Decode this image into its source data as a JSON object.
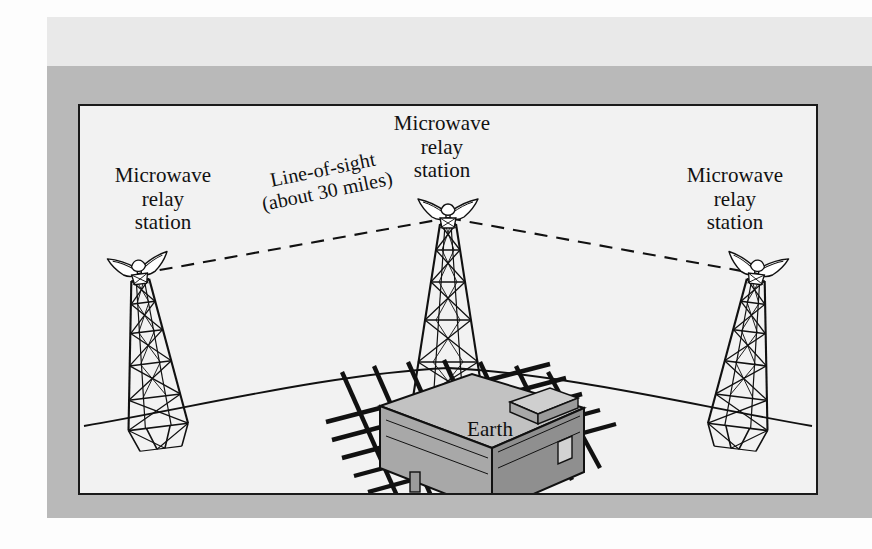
{
  "figure": {
    "kind": "microwave-relay-diagram",
    "frame": {
      "outer_margin_color": "#fdfdfd",
      "top_band_color": "#e9e9e9",
      "mat_color": "#b9b9b9",
      "panel_color": "#f2f2f2",
      "panel_border_color": "#1a1a1a"
    },
    "ink_color": "#111111",
    "building_fill": "#a8a8a8",
    "building_roof_fill": "#c2c2c2",
    "building_side_fill": "#8f8f8f"
  },
  "labels": {
    "left_station": "Microwave\nrelay\nstation",
    "center_station": "Microwave\nrelay\nstation",
    "right_station": "Microwave\nrelay\nstation",
    "line_of_sight": "Line-of-sight\n(about 30 miles)",
    "earth": "Earth"
  },
  "elements": {
    "towers": [
      {
        "name": "left-relay-tower",
        "position": "left",
        "lean": "outward-left"
      },
      {
        "name": "center-relay-tower",
        "position": "center",
        "lean": "upright"
      },
      {
        "name": "right-relay-tower",
        "position": "right",
        "lean": "outward-right"
      }
    ],
    "antennas": [
      {
        "name": "left-horn-antenna"
      },
      {
        "name": "center-horn-antenna"
      },
      {
        "name": "right-horn-antenna"
      }
    ],
    "paths": [
      {
        "name": "line-of-sight-left",
        "style": "dashed",
        "from": "left-relay-tower",
        "to": "center-relay-tower"
      },
      {
        "name": "line-of-sight-right",
        "style": "dashed",
        "from": "center-relay-tower",
        "to": "right-relay-tower"
      }
    ],
    "earth_curve": {
      "name": "earth-horizon-curve",
      "style": "solid-arc"
    },
    "city": {
      "name": "city-building",
      "detail": "street-grid"
    }
  }
}
